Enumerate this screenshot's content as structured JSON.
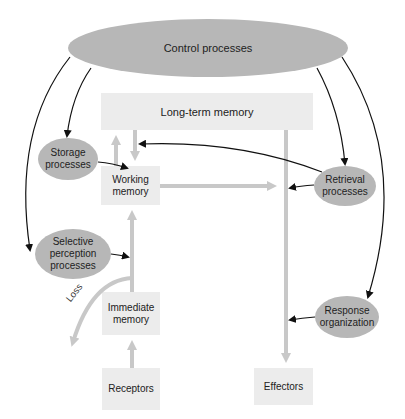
{
  "diagram": {
    "type": "flowchart",
    "colors": {
      "process_ellipse": "#b7b7b7",
      "memory_box": "#ececec",
      "data_flow_arrow": "#c8c8c8",
      "control_arrow": "#111111"
    },
    "nodes": {
      "control": {
        "label": "Control processes",
        "shape": "ellipse"
      },
      "long_term": {
        "label": "Long-term memory",
        "shape": "box"
      },
      "storage": {
        "label_line1": "Storage",
        "label_line2": "processes",
        "shape": "ellipse"
      },
      "working": {
        "label_line1": "Working",
        "label_line2": "memory",
        "shape": "box"
      },
      "retrieval": {
        "label_line1": "Retrieval",
        "label_line2": "processes",
        "shape": "ellipse"
      },
      "selective": {
        "label_line1": "Selective",
        "label_line2": "perception",
        "label_line3": "processes",
        "shape": "ellipse"
      },
      "immediate": {
        "label_line1": "Immediate",
        "label_line2": "memory",
        "shape": "box"
      },
      "response": {
        "label_line1": "Response",
        "label_line2": "organization",
        "shape": "ellipse"
      },
      "receptors": {
        "label": "Receptors",
        "shape": "box"
      },
      "effectors": {
        "label": "Effectors",
        "shape": "box"
      }
    },
    "annotations": {
      "loss": "Loss"
    },
    "edges": [
      {
        "from": "Control processes",
        "to": "Storage processes",
        "kind": "control"
      },
      {
        "from": "Control processes",
        "to": "Selective perception processes",
        "kind": "control"
      },
      {
        "from": "Control processes",
        "to": "Retrieval processes",
        "kind": "control"
      },
      {
        "from": "Control processes",
        "to": "Response organization",
        "kind": "control"
      },
      {
        "from": "Storage processes",
        "to": "Working memory → Long-term memory flow",
        "kind": "control"
      },
      {
        "from": "Retrieval processes",
        "to": "Long-term memory → Working memory flow",
        "kind": "control"
      },
      {
        "from": "Retrieval processes",
        "to": "Working memory → Effectors flow",
        "kind": "control"
      },
      {
        "from": "Selective perception processes",
        "to": "Immediate memory → Working memory flow",
        "kind": "control"
      },
      {
        "from": "Response organization",
        "to": "Long-term memory → Effectors flow",
        "kind": "control"
      },
      {
        "from": "Receptors",
        "to": "Immediate memory",
        "kind": "data"
      },
      {
        "from": "Immediate memory",
        "to": "Working memory",
        "kind": "data"
      },
      {
        "from": "Immediate memory",
        "to": "Loss",
        "kind": "data"
      },
      {
        "from": "Working memory",
        "to": "Long-term memory",
        "kind": "data"
      },
      {
        "from": "Long-term memory",
        "to": "Working memory",
        "kind": "data"
      },
      {
        "from": "Working memory",
        "to": "Effectors",
        "kind": "data"
      },
      {
        "from": "Long-term memory",
        "to": "Effectors",
        "kind": "data"
      }
    ]
  }
}
